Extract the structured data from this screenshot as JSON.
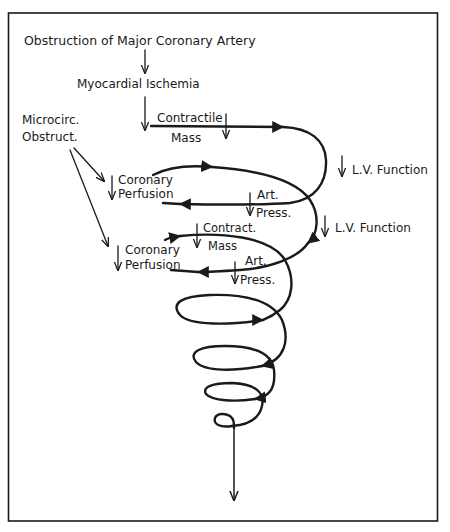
{
  "diagram": {
    "title": "Obstruction of Major Coronary Artery",
    "nodes": {
      "ischemia": "Myocardial Ischemia",
      "microcirc_line1": "Microcirc.",
      "microcirc_line2": "Obstruct.",
      "contractile_line1": "Contractile",
      "contractile_line2": "Mass",
      "lv_function_1": "L.V. Function",
      "coronary_perf_1_line1": "Coronary",
      "coronary_perf_1_line2": "Perfusion",
      "art_press_1_line1": "Art.",
      "art_press_1_line2": "Press.",
      "lv_function_2": "L.V. Function",
      "contract_mass_2_line1": "Contract.",
      "contract_mass_2_line2": "Mass",
      "coronary_perf_2_line1": "Coronary",
      "coronary_perf_2_line2": "Perfusion",
      "art_press_2_line1": "Art.",
      "art_press_2_line2": "Press."
    },
    "decrease_marker": "down-arrow",
    "flow": "downward spiral (vicious cycle)"
  }
}
